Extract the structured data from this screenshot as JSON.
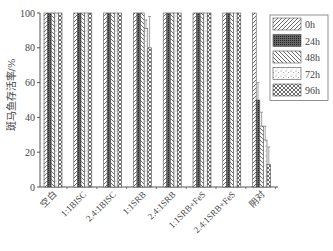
{
  "chart_data": {
    "type": "bar",
    "title": "",
    "xlabel": "",
    "ylabel": "斑马鱼存活率/%",
    "ylim": [
      0,
      100
    ],
    "yticks": [
      0,
      20,
      40,
      60,
      80,
      100
    ],
    "grid": false,
    "legend_position": "upper right",
    "categories": [
      "空白",
      "1:1BISC",
      "2.4:1BISC",
      "1:1SRB",
      "2.4:1SRB",
      "1:1SRB+FeS",
      "2.4:1SRB+FeS",
      "阴对"
    ],
    "series": [
      {
        "name": "0h",
        "pattern": "diag-forward",
        "values": [
          100,
          100,
          100,
          100,
          100,
          100,
          100,
          100
        ],
        "errors": [
          0,
          0,
          0,
          0,
          0,
          0,
          0,
          0
        ]
      },
      {
        "name": "24h",
        "pattern": "dense-dots",
        "values": [
          100,
          100,
          100,
          100,
          100,
          100,
          100,
          50
        ],
        "errors": [
          0,
          0,
          0,
          0,
          0,
          0,
          0,
          10
        ]
      },
      {
        "name": "48h",
        "pattern": "diag-back",
        "values": [
          100,
          100,
          100,
          100,
          100,
          100,
          100,
          35
        ],
        "errors": [
          0,
          0,
          0,
          0,
          0,
          0,
          0,
          8
        ]
      },
      {
        "name": "72h",
        "pattern": "speckle",
        "values": [
          100,
          100,
          100,
          91,
          100,
          100,
          100,
          27
        ],
        "errors": [
          0,
          0,
          0,
          5,
          0,
          0,
          0,
          8
        ]
      },
      {
        "name": "96h",
        "pattern": "crosshatch",
        "values": [
          100,
          100,
          100,
          80,
          100,
          100,
          100,
          13
        ],
        "errors": [
          0,
          0,
          0,
          18,
          0,
          0,
          0,
          10
        ]
      }
    ]
  },
  "axis": {
    "ylabel": "斑马鱼存活率/%"
  },
  "legend": {
    "items": [
      "0h",
      "24h",
      "48h",
      "72h",
      "96h"
    ]
  }
}
